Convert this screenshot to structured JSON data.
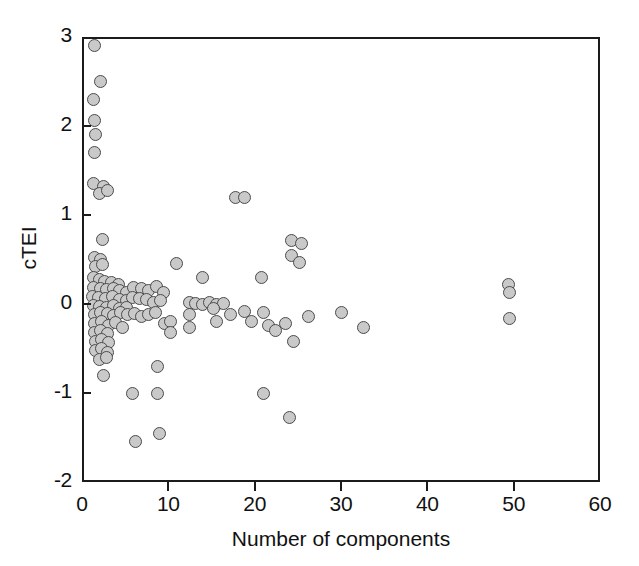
{
  "chart_data": {
    "type": "scatter",
    "title": "",
    "xlabel": "Number of components",
    "ylabel": "cTEI",
    "xlim": [
      0,
      60
    ],
    "ylim": [
      -2,
      3
    ],
    "xticks": [
      0,
      10,
      20,
      30,
      40,
      50,
      60
    ],
    "xticklabels": [
      "0",
      "10",
      "20",
      "30",
      "40",
      "50",
      "60"
    ],
    "yticks": [
      -2,
      -1,
      0,
      1,
      2,
      3
    ],
    "yticklabels": [
      "-2",
      "-1",
      "0",
      "1",
      "2",
      "3"
    ],
    "grid": false,
    "legend": null,
    "marker": {
      "shape": "circle",
      "fill_color": "#c9c9c9",
      "edge_color": "#4b4b4b",
      "size_px": 13
    },
    "n_points": 118,
    "points": [
      [
        1.4,
        2.9
      ],
      [
        2.2,
        2.5
      ],
      [
        1.3,
        2.3
      ],
      [
        1.5,
        2.06
      ],
      [
        1.6,
        1.9
      ],
      [
        1.4,
        1.7
      ],
      [
        1.3,
        1.35
      ],
      [
        2.5,
        1.32
      ],
      [
        2.0,
        1.24
      ],
      [
        3.0,
        1.28
      ],
      [
        17.8,
        1.2
      ],
      [
        18.8,
        1.2
      ],
      [
        2.4,
        0.72
      ],
      [
        24.3,
        0.71
      ],
      [
        25.4,
        0.68
      ],
      [
        24.3,
        0.55
      ],
      [
        25.2,
        0.47
      ],
      [
        1.5,
        0.52
      ],
      [
        2.1,
        0.5
      ],
      [
        1.6,
        0.42
      ],
      [
        2.4,
        0.44
      ],
      [
        11.0,
        0.45
      ],
      [
        1.3,
        0.3
      ],
      [
        2.0,
        0.27
      ],
      [
        2.6,
        0.25
      ],
      [
        3.4,
        0.24
      ],
      [
        4.2,
        0.22
      ],
      [
        14.0,
        0.3
      ],
      [
        20.8,
        0.3
      ],
      [
        1.3,
        0.18
      ],
      [
        2.1,
        0.17
      ],
      [
        2.8,
        0.16
      ],
      [
        3.6,
        0.17
      ],
      [
        4.4,
        0.15
      ],
      [
        5.2,
        0.13
      ],
      [
        6.0,
        0.18
      ],
      [
        6.9,
        0.17
      ],
      [
        7.7,
        0.15
      ],
      [
        8.6,
        0.2
      ],
      [
        9.4,
        0.13
      ],
      [
        49.4,
        0.22
      ],
      [
        49.5,
        0.13
      ],
      [
        1.2,
        0.08
      ],
      [
        1.9,
        0.07
      ],
      [
        2.7,
        0.06
      ],
      [
        3.5,
        0.08
      ],
      [
        4.3,
        0.05
      ],
      [
        5.1,
        0.04
      ],
      [
        5.9,
        0.07
      ],
      [
        6.7,
        0.06
      ],
      [
        7.5,
        0.05
      ],
      [
        8.3,
        0.02
      ],
      [
        9.1,
        0.04
      ],
      [
        1.3,
        -0.02
      ],
      [
        2.0,
        -0.03
      ],
      [
        2.8,
        -0.04
      ],
      [
        3.6,
        -0.02
      ],
      [
        4.4,
        -0.05
      ],
      [
        5.2,
        -0.04
      ],
      [
        12.4,
        0.02
      ],
      [
        13.2,
        0.01
      ],
      [
        14.0,
        0.0
      ],
      [
        14.8,
        0.02
      ],
      [
        15.6,
        0.0
      ],
      [
        16.4,
        0.01
      ],
      [
        1.4,
        -0.12
      ],
      [
        2.1,
        -0.1
      ],
      [
        2.9,
        -0.11
      ],
      [
        3.7,
        -0.13
      ],
      [
        4.5,
        -0.1
      ],
      [
        5.3,
        -0.12
      ],
      [
        6.1,
        -0.11
      ],
      [
        6.9,
        -0.14
      ],
      [
        7.7,
        -0.12
      ],
      [
        8.5,
        -0.1
      ],
      [
        12.4,
        -0.12
      ],
      [
        12.5,
        -0.26
      ],
      [
        15.2,
        -0.05
      ],
      [
        15.6,
        -0.2
      ],
      [
        17.2,
        -0.12
      ],
      [
        18.8,
        -0.08
      ],
      [
        19.6,
        -0.2
      ],
      [
        21.0,
        -0.1
      ],
      [
        21.6,
        -0.24
      ],
      [
        22.4,
        -0.3
      ],
      [
        23.6,
        -0.22
      ],
      [
        26.2,
        -0.14
      ],
      [
        30.0,
        -0.1
      ],
      [
        32.6,
        -0.26
      ],
      [
        49.5,
        -0.16
      ],
      [
        1.5,
        -0.22
      ],
      [
        2.3,
        -0.2
      ],
      [
        3.1,
        -0.24
      ],
      [
        3.9,
        -0.21
      ],
      [
        4.7,
        -0.26
      ],
      [
        9.5,
        -0.22
      ],
      [
        10.3,
        -0.2
      ],
      [
        1.5,
        -0.32
      ],
      [
        2.2,
        -0.3
      ],
      [
        3.0,
        -0.33
      ],
      [
        10.2,
        -0.32
      ],
      [
        24.5,
        -0.42
      ],
      [
        1.6,
        -0.42
      ],
      [
        2.3,
        -0.4
      ],
      [
        3.1,
        -0.43
      ],
      [
        1.6,
        -0.52
      ],
      [
        2.3,
        -0.5
      ],
      [
        3.0,
        -0.54
      ],
      [
        2.0,
        -0.62
      ],
      [
        2.8,
        -0.6
      ],
      [
        2.5,
        -0.8
      ],
      [
        8.8,
        -0.7
      ],
      [
        5.8,
        -1.0
      ],
      [
        8.8,
        -1.0
      ],
      [
        21.0,
        -1.0
      ],
      [
        24.0,
        -1.28
      ],
      [
        6.2,
        -1.55
      ],
      [
        9.0,
        -1.45
      ]
    ]
  }
}
